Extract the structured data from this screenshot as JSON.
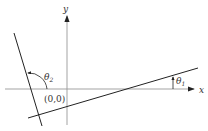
{
  "diagram": {
    "axes": {
      "x_label": "x",
      "y_label": "y",
      "origin_label": "(0,0)"
    },
    "angles": {
      "theta1": {
        "symbol": "θ",
        "subscript": "1"
      },
      "theta2": {
        "symbol": "θ",
        "subscript": "2"
      }
    },
    "colors": {
      "axis": "#888888",
      "line": "#222222",
      "text": "#333333"
    }
  }
}
